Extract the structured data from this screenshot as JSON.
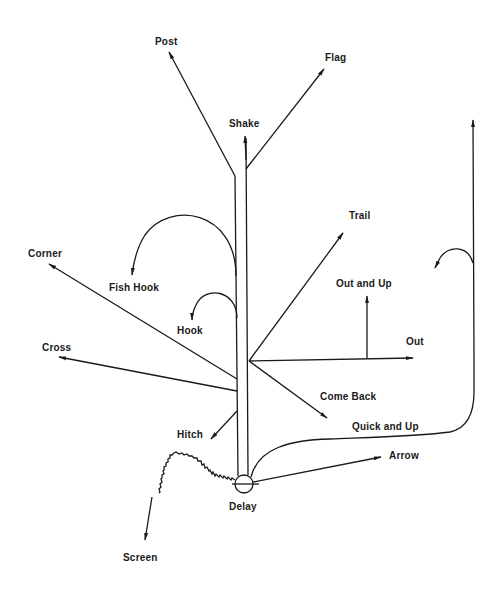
{
  "diagram": {
    "type": "football-route-tree",
    "routes": [
      {
        "id": "post",
        "label": "Post",
        "x": 155,
        "y": 36
      },
      {
        "id": "flag",
        "label": "Flag",
        "x": 325,
        "y": 52
      },
      {
        "id": "shake",
        "label": "Shake",
        "x": 229,
        "y": 118
      },
      {
        "id": "trail",
        "label": "Trail",
        "x": 349,
        "y": 210
      },
      {
        "id": "corner",
        "label": "Corner",
        "x": 28,
        "y": 248
      },
      {
        "id": "fish_hook",
        "label": "Fish Hook",
        "x": 109,
        "y": 282
      },
      {
        "id": "out_and_up",
        "label": "Out and Up",
        "x": 336,
        "y": 278
      },
      {
        "id": "hook",
        "label": "Hook",
        "x": 177,
        "y": 325
      },
      {
        "id": "out",
        "label": "Out",
        "x": 406,
        "y": 336
      },
      {
        "id": "cross",
        "label": "Cross",
        "x": 42,
        "y": 342
      },
      {
        "id": "come_back",
        "label": "Come Back",
        "x": 320,
        "y": 391
      },
      {
        "id": "quick_and_up",
        "label": "Quick and Up",
        "x": 352,
        "y": 421
      },
      {
        "id": "hitch",
        "label": "Hitch",
        "x": 177,
        "y": 429
      },
      {
        "id": "arrow",
        "label": "Arrow",
        "x": 389,
        "y": 450
      },
      {
        "id": "delay",
        "label": "Delay",
        "x": 229,
        "y": 501
      },
      {
        "id": "screen",
        "label": "Screen",
        "x": 123,
        "y": 552
      }
    ]
  }
}
